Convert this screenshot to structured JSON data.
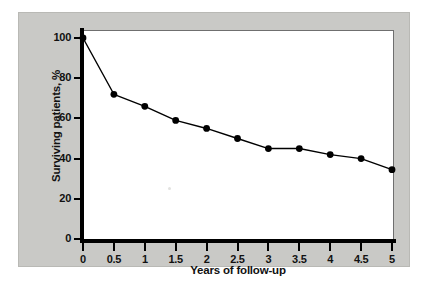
{
  "chart_data": {
    "type": "line",
    "title": "",
    "xlabel": "Years of follow-up",
    "ylabel": "Surviving patients, %",
    "x": [
      0,
      0.5,
      1,
      1.5,
      2,
      2.5,
      3,
      3.5,
      4,
      4.5,
      5
    ],
    "values": [
      100,
      72,
      66,
      59,
      55,
      50,
      45,
      45,
      42,
      40,
      34.5
    ],
    "series": [
      {
        "name": "Surviving patients",
        "values": [
          100,
          72,
          66,
          59,
          55,
          50,
          45,
          45,
          42,
          40,
          34.5
        ]
      }
    ],
    "xtick_labels": [
      "0",
      "0.5",
      "1",
      "1.5",
      "2",
      "2.5",
      "3",
      "3.5",
      "4",
      "4.5",
      "5"
    ],
    "ytick_labels": [
      "0",
      "20",
      "40",
      "60",
      "80",
      "100"
    ],
    "ytick_values": [
      0,
      20,
      40,
      60,
      80,
      100
    ],
    "xlim": [
      0,
      5
    ],
    "ylim": [
      0,
      100
    ],
    "grid": false,
    "legend": false,
    "marker": "filled-circle",
    "line_color": "#000000",
    "marker_color": "#000000",
    "plot_background": "#ffffff",
    "panel_background": "#c9c9c6"
  }
}
